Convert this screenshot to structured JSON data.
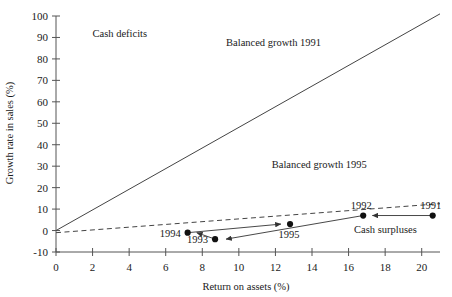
{
  "chart_data": {
    "type": "scatter",
    "title": "",
    "xlabel": "Return on assets (%)",
    "ylabel": "Growth rate in sales (%)",
    "xlim": [
      0,
      21
    ],
    "ylim": [
      -10,
      100
    ],
    "xticks": [
      0,
      2,
      4,
      6,
      8,
      10,
      12,
      14,
      16,
      18,
      20
    ],
    "xtick_labels": [
      "0",
      "2",
      "4",
      "6",
      "8",
      "10",
      "12",
      "14",
      "16",
      "18",
      "20"
    ],
    "yticks": [
      -10,
      0,
      10,
      20,
      30,
      40,
      50,
      60,
      70,
      80,
      90,
      100
    ],
    "ytick_labels": [
      "-10",
      "0",
      "10",
      "20",
      "30",
      "40",
      "50",
      "60",
      "70",
      "80",
      "90",
      "100"
    ],
    "grid": false,
    "legend": "none",
    "series": [
      {
        "name": "Balanced growth 1991",
        "type": "line",
        "style": "solid",
        "label": "Balanced growth 1991",
        "label_xy": [
          9.3,
          86
        ],
        "points": [
          [
            0,
            0
          ],
          [
            21,
            101
          ]
        ],
        "slope": 4.81,
        "intercept": 0
      },
      {
        "name": "Balanced growth 1995",
        "type": "line",
        "style": "dashed",
        "label": "Balanced growth 1995",
        "label_xy": [
          11.8,
          29
        ],
        "points": [
          [
            0,
            -1
          ],
          [
            21,
            12.5
          ]
        ],
        "slope": 0.643,
        "intercept": -1
      },
      {
        "name": "Company trajectory",
        "type": "scatter-path",
        "points": [
          {
            "year": "1991",
            "x": 20.6,
            "y": 7,
            "label": "1991",
            "label_pos": "above-left"
          },
          {
            "year": "1992",
            "x": 16.8,
            "y": 7,
            "label": "1992",
            "label_pos": "above-left"
          },
          {
            "year": "1993",
            "x": 8.7,
            "y": -4,
            "label": "1993",
            "label_pos": "left"
          },
          {
            "year": "1994",
            "x": 7.2,
            "y": -1,
            "label": "1994",
            "label_pos": "left"
          },
          {
            "year": "1995",
            "x": 12.8,
            "y": 3,
            "label": "1995",
            "label_pos": "below-left"
          }
        ],
        "arrows": [
          {
            "from": [
              20.6,
              7
            ],
            "to": [
              17.3,
              7
            ]
          },
          {
            "from": [
              16.8,
              7
            ],
            "to": [
              9.3,
              -4
            ]
          },
          {
            "from": [
              8.7,
              -4
            ],
            "to": [
              7.7,
              -1
            ]
          },
          {
            "from": [
              7.2,
              -1
            ],
            "to": [
              12.3,
              3
            ]
          }
        ]
      }
    ],
    "annotations": [
      {
        "text": "Cash deficits",
        "x": 2.0,
        "y": 90
      },
      {
        "text": "Cash surpluses",
        "x": 16.3,
        "y": -1
      }
    ],
    "colors": {
      "axis": "#555555",
      "line": "#444444",
      "marker": "#111111",
      "text": "#1a1a1a",
      "background": "#ffffff"
    }
  }
}
